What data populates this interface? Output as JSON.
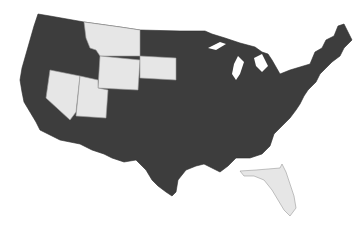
{
  "map": {
    "type": "choropleth",
    "region": "United States (contiguous)",
    "colors": {
      "highlighted": "#3d3d3d",
      "not_highlighted": "#e6e6e6",
      "background": "#ffffff"
    },
    "light_states": [
      "Montana",
      "Wyoming",
      "South Dakota",
      "Nevada",
      "Utah",
      "Florida"
    ],
    "dark_states": "all other contiguous states"
  },
  "caption": ""
}
